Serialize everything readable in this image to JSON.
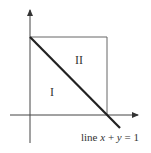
{
  "diagram": {
    "regions": [
      {
        "id": "I",
        "label": "I"
      },
      {
        "id": "II",
        "label": "II"
      }
    ],
    "line_label": {
      "prefix": "line ",
      "x": "x",
      "plus": " + ",
      "y": "y",
      "rest": " = 1"
    },
    "colors": {
      "axis": "#333333",
      "square": "#555555",
      "line": "#222222",
      "background": "#ffffff"
    }
  }
}
